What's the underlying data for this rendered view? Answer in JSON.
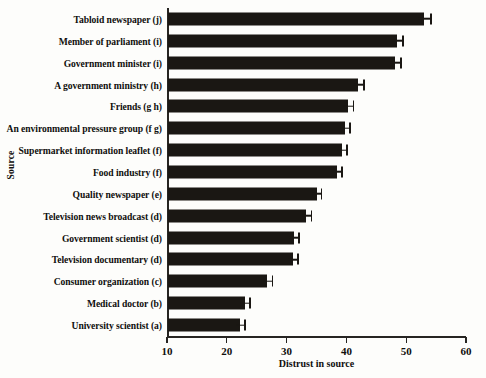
{
  "chart_data": {
    "type": "bar",
    "orientation": "horizontal",
    "title": "",
    "xlabel": "Distrust in source",
    "ylabel": "Source",
    "xlim": [
      10,
      60
    ],
    "xticks": [
      10,
      20,
      30,
      40,
      50,
      60
    ],
    "grid": false,
    "legend": null,
    "bar_color": "#1a1713",
    "axis_color": "#272522",
    "background": "#fdfdfb",
    "categories": [
      "Tabloid newspaper (j)",
      "Member of parliament (i)",
      "Government minister (i)",
      "A government ministry (h)",
      "Friends (g h)",
      "An environmental pressure group (f g)",
      "Supermarket information leaflet (f)",
      "Food industry (f)",
      "Quality newspaper (e)",
      "Television news broadcast (d)",
      "Government scientist (d)",
      "Television documentary (d)",
      "Consumer organization (c)",
      "Medical doctor (b)",
      "University scientist (a)"
    ],
    "values": [
      53.0,
      48.5,
      48.2,
      42.0,
      40.2,
      39.7,
      39.2,
      38.4,
      35.0,
      33.3,
      31.2,
      31.0,
      26.8,
      23.0,
      22.2
    ],
    "errors": [
      1.3,
      1.1,
      1.1,
      1.1,
      1.1,
      1.0,
      1.0,
      1.0,
      1.0,
      1.0,
      1.0,
      1.0,
      1.0,
      1.0,
      1.0
    ]
  }
}
